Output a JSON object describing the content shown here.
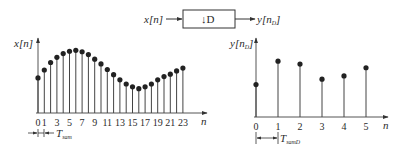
{
  "block_diagram": {
    "input_label": "x[n]",
    "block_label": "↓D",
    "output_label_base": "y[n",
    "output_label_sub": "D",
    "output_label_close": "]"
  },
  "chart_data": [
    {
      "type": "stem",
      "title": "",
      "ylabel": "x[n]",
      "xlabel": "n",
      "x": [
        0,
        1,
        2,
        3,
        4,
        5,
        6,
        7,
        8,
        9,
        10,
        11,
        12,
        13,
        14,
        15,
        16,
        17,
        18,
        19,
        20,
        21,
        22,
        23
      ],
      "values": [
        0.45,
        0.62,
        0.78,
        0.89,
        0.97,
        1.02,
        1.04,
        1.01,
        0.95,
        0.85,
        0.75,
        0.63,
        0.52,
        0.41,
        0.32,
        0.26,
        0.22,
        0.26,
        0.32,
        0.41,
        0.48,
        0.53,
        0.6,
        0.66,
        0.7
      ],
      "tick_labels": [
        "0",
        "1",
        "3",
        "5",
        "7",
        "9",
        "11",
        "13",
        "15",
        "17",
        "19",
        "21",
        "23"
      ],
      "period_label_base": "T",
      "period_label_sub": "sam"
    },
    {
      "type": "stem",
      "title": "",
      "ylabel_base": "y[n",
      "ylabel_sub": "D",
      "xlabel": "n",
      "x": [
        0,
        1,
        2,
        3,
        4,
        5
      ],
      "values": [
        0.45,
        1.02,
        0.95,
        0.58,
        0.66,
        0.86
      ],
      "tick_labels": [
        "0",
        "1",
        "2",
        "3",
        "4",
        "5"
      ],
      "period_label_base": "T",
      "period_label_sub": "samD"
    }
  ]
}
